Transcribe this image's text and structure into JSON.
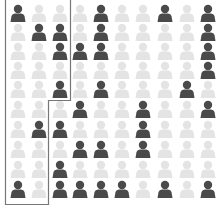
{
  "chart_data": {
    "type": "pictogram",
    "title": "",
    "rows": 10,
    "cols": 10,
    "total": 100,
    "colors": {
      "highlighted": "#4a4a4a",
      "muted": "#e4e4e4",
      "outline": "#777777"
    },
    "legend": [],
    "grid": [
      [
        1,
        0,
        0,
        0,
        1,
        0,
        0,
        1,
        0,
        1
      ],
      [
        0,
        1,
        1,
        0,
        1,
        0,
        0,
        0,
        0,
        1
      ],
      [
        0,
        0,
        1,
        1,
        1,
        0,
        0,
        0,
        0,
        1
      ],
      [
        0,
        0,
        0,
        0,
        0,
        0,
        0,
        0,
        0,
        1
      ],
      [
        0,
        0,
        1,
        0,
        1,
        0,
        0,
        0,
        1,
        0
      ],
      [
        0,
        0,
        0,
        1,
        0,
        0,
        1,
        0,
        0,
        1
      ],
      [
        0,
        1,
        1,
        0,
        0,
        0,
        1,
        0,
        0,
        0
      ],
      [
        0,
        0,
        0,
        1,
        1,
        0,
        1,
        0,
        0,
        0
      ],
      [
        0,
        0,
        1,
        0,
        0,
        0,
        0,
        0,
        0,
        0
      ],
      [
        1,
        0,
        1,
        1,
        1,
        1,
        0,
        1,
        0,
        1
      ]
    ],
    "highlighted_count": 32,
    "outlined_region": {
      "description": "Stepped outline enclosing columns 1-3 for rows 1-5 and columns 1-2 for rows 6-10",
      "cells_enclosed": 25,
      "highlighted_inside": 8
    }
  }
}
